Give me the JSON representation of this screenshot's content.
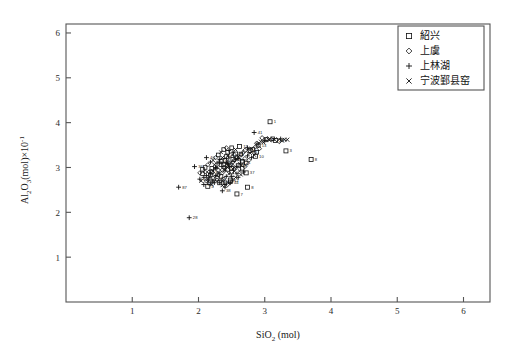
{
  "figure": {
    "background": "#ffffff",
    "axis_color": "#555555",
    "marker_color": "#111111"
  },
  "axes": {
    "x_title": "SiO₂ (mol)",
    "y_title": "Al₂O₃(mol)×10⁻¹",
    "x_ticks": [
      "1",
      "2",
      "3",
      "4",
      "5",
      "6"
    ],
    "y_ticks": [
      "1",
      "2",
      "3",
      "4",
      "5",
      "6"
    ]
  },
  "legend": {
    "items": [
      {
        "label": "紹兴",
        "marker": "square"
      },
      {
        "label": "上虞",
        "marker": "diamond"
      },
      {
        "label": "上林湖",
        "marker": "plus"
      },
      {
        "label": "宁波鄞县窑",
        "marker": "cross"
      }
    ]
  },
  "chart_data": {
    "type": "scatter",
    "title": "",
    "xlabel": "SiO₂ (mol)",
    "ylabel": "Al₂O₃(mol)×10⁻¹",
    "xlim": [
      0,
      6.4
    ],
    "ylim": [
      0,
      6.2
    ],
    "grid": false,
    "legend_position": "upper-right",
    "series": [
      {
        "name": "紹兴",
        "marker": "square",
        "points": [
          {
            "x": 3.08,
            "y": 4.02,
            "label": "1"
          },
          {
            "x": 2.62,
            "y": 3.47,
            "label": "11"
          },
          {
            "x": 3.32,
            "y": 3.37,
            "label": "3"
          },
          {
            "x": 3.7,
            "y": 3.18,
            "label": "8"
          },
          {
            "x": 2.86,
            "y": 3.25,
            "label": "10"
          },
          {
            "x": 2.72,
            "y": 2.88,
            "label": "37"
          },
          {
            "x": 2.74,
            "y": 2.56,
            "label": "8"
          },
          {
            "x": 2.58,
            "y": 2.41,
            "label": "7"
          },
          {
            "x": 2.32,
            "y": 2.66,
            "label": "14"
          },
          {
            "x": 2.14,
            "y": 2.58,
            "label": "4"
          },
          {
            "x": 2.28,
            "y": 2.76,
            "label": "22"
          },
          {
            "x": 2.52,
            "y": 3.18,
            "label": "28"
          },
          {
            "x": 3.02,
            "y": 3.62,
            "label": "30"
          },
          {
            "x": 3.16,
            "y": 3.6,
            "label": "24"
          },
          {
            "x": 2.44,
            "y": 2.96,
            "label": "19"
          },
          {
            "x": 2.38,
            "y": 3.06,
            "label": "25"
          },
          {
            "x": 2.56,
            "y": 3.3,
            "label": "16"
          },
          {
            "x": 2.66,
            "y": 3.12,
            "label": "21"
          },
          {
            "x": 2.2,
            "y": 2.9,
            "label": "35"
          },
          {
            "x": 2.48,
            "y": 2.72,
            "label": "12"
          },
          {
            "x": 2.6,
            "y": 3.04,
            "label": "18"
          },
          {
            "x": 2.34,
            "y": 3.14,
            "label": "26"
          },
          {
            "x": 2.78,
            "y": 3.38,
            "label": "9"
          },
          {
            "x": 2.9,
            "y": 3.5,
            "label": "13"
          },
          {
            "x": 2.42,
            "y": 3.24,
            "label": "27"
          }
        ]
      },
      {
        "name": "上虞",
        "marker": "diamond",
        "points": [
          {
            "x": 2.96,
            "y": 3.66,
            "label": ""
          },
          {
            "x": 3.04,
            "y": 3.64,
            "label": ""
          },
          {
            "x": 3.1,
            "y": 3.62,
            "label": ""
          },
          {
            "x": 2.76,
            "y": 3.36,
            "label": "46"
          },
          {
            "x": 2.7,
            "y": 3.38,
            "label": ""
          },
          {
            "x": 2.52,
            "y": 3.02,
            "label": ""
          },
          {
            "x": 2.46,
            "y": 3.1,
            "label": ""
          },
          {
            "x": 2.58,
            "y": 3.22,
            "label": ""
          },
          {
            "x": 2.36,
            "y": 2.94,
            "label": ""
          },
          {
            "x": 2.64,
            "y": 3.28,
            "label": ""
          },
          {
            "x": 2.3,
            "y": 2.84,
            "label": ""
          },
          {
            "x": 2.88,
            "y": 3.54,
            "label": ""
          },
          {
            "x": 3.22,
            "y": 3.58,
            "label": ""
          },
          {
            "x": 2.4,
            "y": 3.0,
            "label": ""
          },
          {
            "x": 2.54,
            "y": 3.16,
            "label": ""
          }
        ]
      },
      {
        "name": "上林湖",
        "marker": "plus",
        "points": [
          {
            "x": 2.84,
            "y": 3.78,
            "label": "41"
          },
          {
            "x": 2.12,
            "y": 3.22,
            "label": "40"
          },
          {
            "x": 1.94,
            "y": 3.02,
            "label": "36"
          },
          {
            "x": 1.7,
            "y": 2.56,
            "label": "87"
          },
          {
            "x": 1.86,
            "y": 1.88,
            "label": "28"
          },
          {
            "x": 2.36,
            "y": 2.48,
            "label": "38"
          },
          {
            "x": 2.48,
            "y": 2.66,
            "label": "44"
          },
          {
            "x": 2.02,
            "y": 2.74,
            "label": "69"
          },
          {
            "x": 2.08,
            "y": 2.62,
            "label": "54"
          },
          {
            "x": 2.68,
            "y": 2.9,
            "label": ""
          },
          {
            "x": 2.26,
            "y": 2.98,
            "label": ""
          },
          {
            "x": 2.18,
            "y": 2.86,
            "label": ""
          },
          {
            "x": 2.44,
            "y": 3.08,
            "label": ""
          },
          {
            "x": 2.6,
            "y": 3.2,
            "label": ""
          },
          {
            "x": 2.32,
            "y": 3.12,
            "label": ""
          },
          {
            "x": 2.5,
            "y": 2.8,
            "label": ""
          },
          {
            "x": 2.22,
            "y": 2.7,
            "label": ""
          },
          {
            "x": 2.74,
            "y": 3.44,
            "label": ""
          },
          {
            "x": 2.4,
            "y": 2.62,
            "label": ""
          },
          {
            "x": 2.16,
            "y": 2.78,
            "label": ""
          }
        ]
      },
      {
        "name": "宁波鄞县窑",
        "marker": "cross",
        "points": [
          {
            "x": 3.26,
            "y": 3.6,
            "label": ""
          },
          {
            "x": 3.34,
            "y": 3.62,
            "label": ""
          },
          {
            "x": 2.98,
            "y": 3.56,
            "label": ""
          },
          {
            "x": 2.8,
            "y": 3.42,
            "label": ""
          },
          {
            "x": 2.64,
            "y": 3.06,
            "label": ""
          },
          {
            "x": 2.54,
            "y": 2.92,
            "label": ""
          },
          {
            "x": 2.28,
            "y": 3.02,
            "label": ""
          },
          {
            "x": 2.44,
            "y": 3.26,
            "label": ""
          }
        ]
      }
    ],
    "cluster_fill_points": [
      [
        2.34,
        3.06
      ],
      [
        2.38,
        3.0
      ],
      [
        2.42,
        3.1
      ],
      [
        2.46,
        3.04
      ],
      [
        2.5,
        2.98
      ],
      [
        2.3,
        2.94
      ],
      [
        2.26,
        3.0
      ],
      [
        2.22,
        2.92
      ],
      [
        2.18,
        2.84
      ],
      [
        2.36,
        2.88
      ],
      [
        2.4,
        2.94
      ],
      [
        2.44,
        3.0
      ],
      [
        2.48,
        3.06
      ],
      [
        2.52,
        3.12
      ],
      [
        2.56,
        3.18
      ],
      [
        2.6,
        3.24
      ],
      [
        2.64,
        3.3
      ],
      [
        2.68,
        3.34
      ],
      [
        2.32,
        3.18
      ],
      [
        2.36,
        3.22
      ],
      [
        2.4,
        3.16
      ],
      [
        2.44,
        3.2
      ],
      [
        2.28,
        3.1
      ],
      [
        2.24,
        3.06
      ],
      [
        2.2,
        2.98
      ],
      [
        2.16,
        2.9
      ],
      [
        2.12,
        2.82
      ],
      [
        2.14,
        2.74
      ],
      [
        2.18,
        2.7
      ],
      [
        2.22,
        2.76
      ],
      [
        2.26,
        2.82
      ],
      [
        2.3,
        2.86
      ],
      [
        2.34,
        2.8
      ],
      [
        2.38,
        2.74
      ],
      [
        2.42,
        2.8
      ],
      [
        2.46,
        2.86
      ],
      [
        2.5,
        2.9
      ],
      [
        2.54,
        2.96
      ],
      [
        2.58,
        3.02
      ],
      [
        2.62,
        3.08
      ],
      [
        2.66,
        3.14
      ],
      [
        2.7,
        3.2
      ],
      [
        2.74,
        3.26
      ],
      [
        2.78,
        3.32
      ],
      [
        2.82,
        3.4
      ],
      [
        2.86,
        3.46
      ],
      [
        2.9,
        3.52
      ],
      [
        2.94,
        3.58
      ],
      [
        2.44,
        3.34
      ],
      [
        2.48,
        3.28
      ],
      [
        2.52,
        3.34
      ],
      [
        2.56,
        3.4
      ],
      [
        2.5,
        3.44
      ],
      [
        2.54,
        3.28
      ],
      [
        2.32,
        2.66
      ],
      [
        2.36,
        2.7
      ],
      [
        2.4,
        2.66
      ],
      [
        2.28,
        2.72
      ],
      [
        2.24,
        2.66
      ],
      [
        2.2,
        2.62
      ],
      [
        2.16,
        2.66
      ],
      [
        2.12,
        2.7
      ],
      [
        2.08,
        2.78
      ],
      [
        2.04,
        2.7
      ],
      [
        2.06,
        2.86
      ],
      [
        2.1,
        2.9
      ],
      [
        2.58,
        2.86
      ],
      [
        2.62,
        2.92
      ],
      [
        2.66,
        2.98
      ],
      [
        2.7,
        3.02
      ],
      [
        2.6,
        2.78
      ],
      [
        2.64,
        2.84
      ],
      [
        2.38,
        3.4
      ],
      [
        2.42,
        3.44
      ],
      [
        2.46,
        3.38
      ],
      [
        2.34,
        3.34
      ],
      [
        2.3,
        3.28
      ],
      [
        2.26,
        3.22
      ],
      [
        2.52,
        2.72
      ],
      [
        2.56,
        2.78
      ],
      [
        2.48,
        2.68
      ],
      [
        2.44,
        2.62
      ],
      [
        2.4,
        2.56
      ],
      [
        2.36,
        2.6
      ],
      [
        2.72,
        3.1
      ],
      [
        2.76,
        3.16
      ],
      [
        2.8,
        3.22
      ],
      [
        2.84,
        3.28
      ],
      [
        2.88,
        3.34
      ],
      [
        2.92,
        3.42
      ],
      [
        3.0,
        3.6
      ],
      [
        3.06,
        3.62
      ],
      [
        3.12,
        3.64
      ],
      [
        3.18,
        3.62
      ],
      [
        3.24,
        3.64
      ],
      [
        3.3,
        3.62
      ],
      [
        2.1,
        3.0
      ],
      [
        2.14,
        3.06
      ],
      [
        2.18,
        3.12
      ],
      [
        2.22,
        3.16
      ],
      [
        2.06,
        2.96
      ],
      [
        2.02,
        2.88
      ]
    ]
  }
}
